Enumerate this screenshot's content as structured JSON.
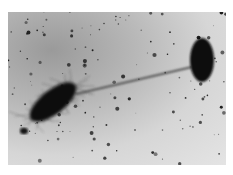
{
  "image": {
    "description": "Electron micrograph of two rod-shaped bacteria connected by a long pilus/flagellum-like filament, with scattered dark particles on a grey background",
    "subjects": [
      {
        "name": "large-bacterium",
        "description": "rod-shaped cell covered in fine hair-like pili, lower-left"
      },
      {
        "name": "small-bacterium",
        "description": "smooth oval cell, upper-right"
      },
      {
        "name": "connecting-filament",
        "description": "long thin filament linking the two cells"
      }
    ],
    "colors": {
      "background": "#d0d0d0",
      "cells": "#101010",
      "particles": "#202020"
    }
  }
}
